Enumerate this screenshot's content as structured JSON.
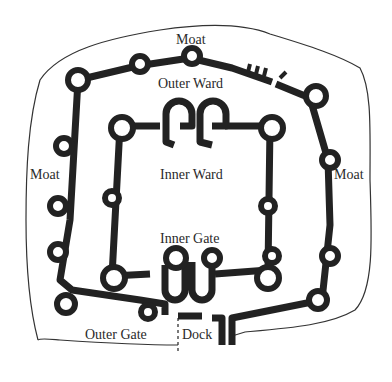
{
  "diagram": {
    "type": "castle floor plan",
    "colors": {
      "ink": "#222222",
      "background": "#ffffff"
    },
    "labels": {
      "moat_top": "Moat",
      "moat_left": "Moat",
      "moat_right": "Moat",
      "outer_ward": "Outer Ward",
      "inner_ward": "Inner Ward",
      "inner_gate": "Inner Gate",
      "outer_gate": "Outer Gate",
      "dock": "Dock"
    }
  }
}
